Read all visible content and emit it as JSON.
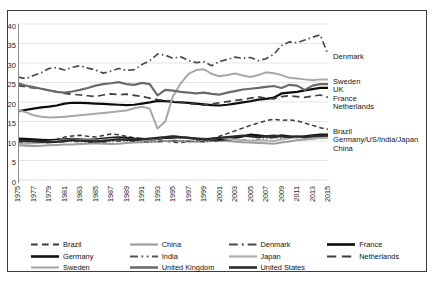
{
  "chart_data": {
    "type": "line",
    "title": "",
    "xlabel": "",
    "ylabel": "",
    "ylim": [
      0,
      40
    ],
    "ytick_step": 5,
    "grid": true,
    "legend_position": "bottom",
    "x": [
      1975,
      1976,
      1977,
      1978,
      1979,
      1980,
      1981,
      1982,
      1983,
      1984,
      1985,
      1986,
      1987,
      1988,
      1989,
      1990,
      1991,
      1992,
      1993,
      1994,
      1995,
      1996,
      1997,
      1998,
      1999,
      2000,
      2001,
      2002,
      2003,
      2004,
      2005,
      2006,
      2007,
      2008,
      2009,
      2010,
      2011,
      2012,
      2013,
      2014,
      2015
    ],
    "xtick_labels": [
      "1975",
      "1977",
      "1979",
      "1981",
      "1983",
      "1985",
      "1987",
      "1989",
      "1991",
      "1993",
      "1995",
      "1997",
      "1999",
      "2001",
      "2003",
      "2005",
      "2007",
      "2009",
      "2011",
      "2013",
      "2015"
    ],
    "ytick_labels": [
      "0",
      "5",
      "10",
      "15",
      "20",
      "25",
      "30",
      "35",
      "40"
    ],
    "series": [
      {
        "name": "Brazil",
        "color": "#3a3a3a",
        "style": "dashed",
        "width": 1.5,
        "values": [
          10.2,
          10.0,
          9.8,
          9.9,
          10.1,
          10.4,
          11.0,
          11.3,
          11.5,
          11.2,
          11.0,
          11.4,
          11.8,
          11.6,
          11.2,
          10.8,
          10.6,
          10.5,
          10.3,
          10.0,
          9.7,
          9.6,
          9.8,
          10.0,
          10.2,
          10.6,
          11.2,
          11.9,
          12.6,
          13.3,
          14.0,
          14.6,
          15.2,
          15.6,
          15.3,
          15.4,
          15.2,
          14.6,
          14.0,
          13.4,
          13.0
        ]
      },
      {
        "name": "China",
        "color": "#9e9e9e",
        "style": "solid",
        "width": 2.0,
        "values": [
          8.9,
          8.8,
          8.7,
          8.8,
          8.9,
          9.0,
          9.1,
          9.1,
          9.2,
          9.3,
          9.4,
          9.3,
          9.2,
          9.3,
          9.5,
          9.6,
          9.7,
          9.8,
          9.9,
          10.0,
          10.1,
          10.0,
          9.9,
          9.8,
          9.9,
          10.0,
          10.1,
          10.0,
          9.8,
          9.7,
          9.6,
          9.5,
          9.4,
          9.3,
          9.6,
          9.9,
          10.2,
          10.4,
          10.6,
          10.8,
          10.9
        ]
      },
      {
        "name": "Denmark",
        "color": "#4a4a4a",
        "style": "dashdot",
        "width": 1.7,
        "values": [
          26.4,
          26.0,
          26.8,
          27.5,
          28.6,
          28.8,
          28.2,
          28.9,
          29.3,
          28.7,
          28.2,
          27.4,
          27.9,
          28.6,
          28.1,
          28.3,
          29.6,
          30.6,
          32.3,
          32.0,
          31.2,
          31.6,
          30.6,
          30.1,
          30.3,
          29.3,
          30.4,
          30.9,
          31.5,
          31.2,
          31.4,
          30.6,
          31.1,
          32.2,
          34.5,
          35.4,
          35.2,
          35.9,
          36.6,
          37.2,
          32.2
        ]
      },
      {
        "name": "France",
        "color": "#0d0d0d",
        "style": "solid",
        "width": 2.2,
        "values": [
          17.6,
          18.0,
          18.3,
          18.6,
          18.8,
          19.1,
          19.6,
          19.8,
          19.8,
          19.7,
          19.6,
          19.5,
          19.4,
          19.3,
          19.2,
          19.3,
          19.6,
          19.9,
          20.3,
          20.2,
          20.0,
          19.9,
          19.8,
          19.6,
          19.4,
          19.2,
          19.1,
          19.3,
          19.6,
          19.9,
          20.2,
          20.6,
          20.8,
          21.1,
          22.2,
          22.4,
          22.6,
          23.0,
          23.3,
          23.6,
          23.6
        ]
      },
      {
        "name": "Germany",
        "color": "#111111",
        "style": "solid",
        "width": 2.4,
        "values": [
          10.6,
          10.5,
          10.4,
          10.3,
          10.2,
          10.3,
          10.4,
          10.5,
          10.4,
          10.3,
          10.4,
          10.6,
          10.8,
          10.9,
          10.8,
          10.6,
          10.5,
          10.4,
          10.6,
          10.8,
          10.9,
          11.0,
          10.8,
          10.6,
          10.5,
          10.4,
          10.3,
          10.5,
          10.8,
          11.2,
          11.6,
          11.4,
          11.2,
          11.0,
          11.4,
          11.2,
          11.0,
          11.2,
          11.4,
          11.6,
          11.6
        ]
      },
      {
        "name": "India",
        "color": "#555555",
        "style": "dashdotdot",
        "width": 1.4,
        "values": [
          9.6,
          9.5,
          9.4,
          9.5,
          9.6,
          9.7,
          9.8,
          9.9,
          9.8,
          9.7,
          9.6,
          9.7,
          9.8,
          9.9,
          10.0,
          9.9,
          9.8,
          9.7,
          9.8,
          9.9,
          10.0,
          10.1,
          10.0,
          9.9,
          9.8,
          9.9,
          10.0,
          10.2,
          10.4,
          10.3,
          10.2,
          10.4,
          10.6,
          10.8,
          10.7,
          10.9,
          11.1,
          11.0,
          11.2,
          11.3,
          11.4
        ]
      },
      {
        "name": "Japan",
        "color": "#b0b0b0",
        "style": "solid",
        "width": 2.0,
        "values": [
          9.2,
          9.3,
          9.4,
          9.6,
          9.8,
          10.0,
          10.2,
          10.4,
          10.3,
          10.2,
          10.1,
          10.3,
          10.5,
          10.6,
          10.4,
          10.3,
          10.2,
          10.4,
          10.7,
          11.0,
          11.2,
          11.0,
          10.8,
          10.6,
          10.5,
          10.6,
          10.8,
          10.6,
          10.4,
          10.2,
          10.0,
          10.2,
          10.1,
          10.0,
          10.4,
          10.7,
          11.0,
          10.8,
          10.6,
          10.8,
          11.0
        ]
      },
      {
        "name": "Netherlands",
        "color": "#3f3f3f",
        "style": "longdash",
        "width": 1.7,
        "values": [
          24.2,
          23.9,
          23.6,
          23.4,
          23.0,
          22.6,
          22.2,
          22.0,
          21.8,
          21.6,
          21.4,
          21.8,
          22.1,
          21.9,
          22.0,
          21.7,
          21.4,
          21.0,
          20.6,
          20.4,
          20.2,
          20.0,
          19.6,
          19.4,
          19.2,
          19.5,
          19.8,
          20.1,
          20.4,
          20.6,
          21.0,
          21.3,
          21.0,
          20.8,
          21.4,
          21.6,
          21.4,
          21.2,
          21.5,
          21.8,
          21.2
        ]
      },
      {
        "name": "Sweden",
        "color": "#a8a8a8",
        "style": "solid",
        "width": 2.0,
        "values": [
          17.9,
          17.4,
          16.6,
          16.2,
          16.0,
          16.1,
          16.2,
          16.4,
          16.6,
          16.8,
          17.0,
          17.2,
          17.4,
          17.6,
          17.8,
          18.4,
          18.8,
          18.3,
          13.2,
          15.0,
          21.5,
          24.8,
          27.2,
          28.2,
          28.4,
          27.2,
          26.6,
          26.9,
          27.3,
          26.8,
          26.4,
          26.9,
          27.6,
          27.4,
          26.9,
          26.2,
          26.0,
          25.8,
          25.6,
          25.8,
          25.8
        ]
      },
      {
        "name": "United Kingdom",
        "color": "#6b6b6b",
        "style": "solid",
        "width": 2.2,
        "values": [
          24.8,
          24.2,
          23.8,
          23.4,
          23.0,
          22.6,
          22.4,
          22.7,
          23.1,
          23.6,
          24.2,
          24.6,
          24.8,
          25.1,
          24.6,
          24.4,
          24.9,
          24.6,
          21.7,
          23.1,
          22.9,
          22.6,
          22.4,
          22.2,
          22.4,
          22.1,
          21.9,
          22.4,
          22.8,
          23.2,
          23.4,
          23.6,
          23.9,
          24.1,
          23.6,
          24.4,
          24.2,
          23.1,
          24.2,
          24.6,
          24.6
        ]
      },
      {
        "name": "United States",
        "color": "#2a2a2a",
        "style": "solid",
        "width": 2.3,
        "values": [
          10.1,
          10.0,
          9.9,
          9.8,
          9.7,
          9.8,
          10.0,
          10.2,
          10.1,
          10.0,
          9.9,
          10.0,
          10.2,
          10.4,
          10.3,
          10.2,
          10.4,
          10.6,
          10.8,
          11.0,
          11.2,
          11.0,
          10.8,
          10.6,
          10.4,
          10.6,
          10.8,
          11.0,
          11.2,
          11.4,
          11.2,
          11.0,
          11.2,
          11.4,
          11.2,
          11.0,
          11.2,
          11.0,
          11.2,
          11.3,
          11.4
        ]
      }
    ],
    "right_annotations": [
      {
        "label": "Denmark",
        "value": 32.2
      },
      {
        "label": "Sweden",
        "value": 25.8
      },
      {
        "label": "UK",
        "value": 24.6
      },
      {
        "label": "France",
        "value": 23.6
      },
      {
        "label": "Netherlands",
        "value": 21.2
      },
      {
        "label": "Brazil",
        "value": 13.0
      },
      {
        "label": "Germany/US/India/Japan",
        "value": 11.4
      },
      {
        "label": "China",
        "value": 10.9
      }
    ],
    "legend": [
      {
        "label": "Brazil",
        "color": "#3a3a3a",
        "style": "dashed"
      },
      {
        "label": "China",
        "color": "#9e9e9e",
        "style": "solid"
      },
      {
        "label": "Denmark",
        "color": "#4a4a4a",
        "style": "dashdot"
      },
      {
        "label": "France",
        "color": "#0d0d0d",
        "style": "solid"
      },
      {
        "label": "Germany",
        "color": "#111111",
        "style": "solid"
      },
      {
        "label": "India",
        "color": "#555555",
        "style": "dashdotdot"
      },
      {
        "label": "Japan",
        "color": "#b0b0b0",
        "style": "solid"
      },
      {
        "label": "Netherlands",
        "color": "#3f3f3f",
        "style": "longdash"
      },
      {
        "label": "Sweden",
        "color": "#a8a8a8",
        "style": "solid"
      },
      {
        "label": "United Kingdom",
        "color": "#6b6b6b",
        "style": "solid"
      },
      {
        "label": "United States",
        "color": "#2a2a2a",
        "style": "solid"
      }
    ]
  }
}
